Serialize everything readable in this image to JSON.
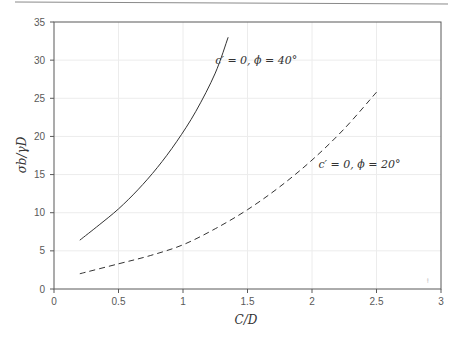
{
  "chart_data": {
    "type": "line",
    "title": "",
    "xlabel": "C/D",
    "ylabel": "σb/γD",
    "xlim": [
      0,
      3
    ],
    "ylim": [
      0,
      35
    ],
    "xticks": [
      0,
      0.5,
      1,
      1.5,
      2,
      2.5,
      3
    ],
    "xtick_labels": [
      "0",
      "0.5",
      "1",
      "1.5",
      "2",
      "2.5",
      "3"
    ],
    "yticks": [
      0,
      5,
      10,
      15,
      20,
      25,
      30,
      35
    ],
    "ytick_labels": [
      "0",
      "5",
      "10",
      "15",
      "20",
      "25",
      "30",
      "35"
    ],
    "grid": true,
    "legend": null,
    "series": [
      {
        "name": "c' = 0, φ = 40°",
        "style": "solid",
        "color": "#333333",
        "x": [
          0.2,
          0.35,
          0.5,
          0.65,
          0.8,
          0.95,
          1.1,
          1.25,
          1.35
        ],
        "y": [
          6.4,
          8.4,
          10.5,
          13.0,
          15.9,
          19.3,
          23.3,
          28.3,
          33.0
        ]
      },
      {
        "name": "c' = 0, φ = 20°",
        "style": "dashed",
        "color": "#333333",
        "x": [
          0.2,
          0.5,
          0.75,
          1.0,
          1.25,
          1.5,
          1.75,
          2.0,
          2.25,
          2.5
        ],
        "y": [
          2.0,
          3.3,
          4.4,
          5.8,
          7.9,
          10.4,
          13.4,
          16.9,
          21.0,
          25.8
        ]
      }
    ],
    "annotations": [
      {
        "text": "c′ = 0, ϕ = 40°",
        "x": 1.25,
        "y": 29.5
      },
      {
        "text": "c′ = 0, ϕ = 20°",
        "x": 2.05,
        "y": 15.8
      }
    ]
  }
}
